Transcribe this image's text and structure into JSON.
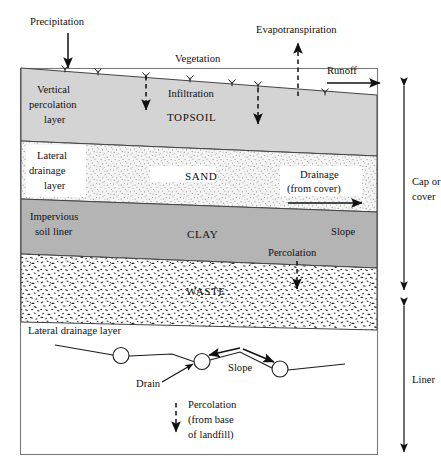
{
  "figure": {
    "top_labels": {
      "precipitation": "Precipitation",
      "vegetation": "Vegetation",
      "evapotranspiration": "Evapotranspiration",
      "runoff": "Runoff",
      "infiltration": "Infiltration"
    },
    "left_labels": {
      "vertical_percolation": [
        "Vertical",
        "percolation",
        "layer"
      ],
      "lateral_drainage": [
        "Lateral",
        "drainage",
        "layer"
      ],
      "impervious_soil_liner": [
        "Impervious",
        "soil liner"
      ],
      "lateral_drainage_layer_detail": "Lateral drainage layer"
    },
    "layers": [
      {
        "name": "TOPSOIL",
        "fill": "#d4d4d4",
        "pattern": "solid-grey"
      },
      {
        "name": "SAND",
        "fill": "#f2f2f2",
        "pattern": "fine-stipple"
      },
      {
        "name": "CLAY",
        "fill": "#b4b4b4",
        "pattern": "solid-grey"
      },
      {
        "name": "WASTE",
        "fill": "#ffffff",
        "pattern": "coarse-speckle"
      }
    ],
    "inner_labels": {
      "drainage": [
        "Drainage",
        "(from cover)"
      ],
      "slope_cover": "Slope",
      "percolation": "Percolation",
      "slope_detail": "Slope",
      "drain": "Drain",
      "percolation_base": [
        "Percolation",
        "(from base",
        "of landfill)"
      ]
    },
    "right_brackets": [
      {
        "label": [
          "Cap or",
          "cover"
        ],
        "from_y": 78,
        "to_y": 295
      },
      {
        "label": [
          "Liner"
        ],
        "from_y": 300,
        "to_y": 458
      }
    ],
    "colors": {
      "line": "#1a1a1a",
      "frame": "#7a7a7a",
      "topsoil": "#d4d4d4",
      "sand": "#f2f2f2",
      "clay": "#b4b4b4",
      "waste": "#ffffff",
      "background": "#ffffff"
    }
  }
}
